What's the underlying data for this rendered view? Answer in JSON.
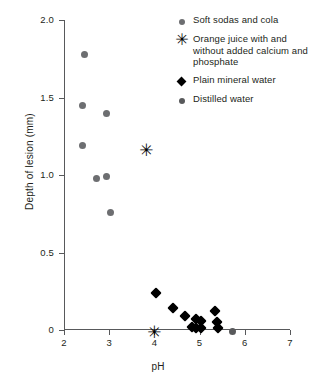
{
  "chart_data": {
    "type": "scatter",
    "title": "",
    "xlabel": "pH",
    "ylabel": "Depth of lesion (mm)",
    "xlim": [
      2,
      7
    ],
    "ylim": [
      0,
      2.0
    ],
    "xticks": [
      "2",
      "3",
      "4",
      "5",
      "6",
      "7"
    ],
    "xtick_values": [
      2,
      3,
      4,
      5,
      6,
      7
    ],
    "yticks": [
      "0",
      "0.5",
      "1.0",
      "1.5",
      "2.0"
    ],
    "ytick_values": [
      0,
      0.5,
      1.0,
      1.5,
      2.0
    ],
    "grid": false,
    "legend_position": "top-right",
    "series": [
      {
        "name": "Soft sodas and cola",
        "marker": "circle",
        "color": "#6d6e71",
        "points": [
          {
            "x": 2.45,
            "y": 1.78
          },
          {
            "x": 2.4,
            "y": 1.45
          },
          {
            "x": 2.95,
            "y": 1.4
          },
          {
            "x": 2.42,
            "y": 1.19
          },
          {
            "x": 2.72,
            "y": 0.98
          },
          {
            "x": 2.95,
            "y": 0.99
          },
          {
            "x": 3.03,
            "y": 0.76
          }
        ]
      },
      {
        "name": "Orange juice with and without added calcium and phosphate",
        "marker": "asterisk",
        "color": "#000000",
        "points": [
          {
            "x": 3.82,
            "y": 1.16
          },
          {
            "x": 4.0,
            "y": -0.01
          }
        ]
      },
      {
        "name": "Plain mineral water",
        "marker": "diamond",
        "color": "#000000",
        "points": [
          {
            "x": 4.03,
            "y": 0.24
          },
          {
            "x": 4.42,
            "y": 0.14
          },
          {
            "x": 4.67,
            "y": 0.09
          },
          {
            "x": 4.83,
            "y": 0.02
          },
          {
            "x": 4.92,
            "y": 0.07
          },
          {
            "x": 4.93,
            "y": 0.01
          },
          {
            "x": 5.02,
            "y": 0.06
          },
          {
            "x": 5.03,
            "y": 0.01
          },
          {
            "x": 5.35,
            "y": 0.12
          },
          {
            "x": 5.38,
            "y": 0.05
          },
          {
            "x": 5.4,
            "y": 0.01
          }
        ]
      },
      {
        "name": "Distilled water",
        "marker": "circle",
        "color": "#58595b",
        "points": [
          {
            "x": 5.72,
            "y": -0.01
          }
        ]
      }
    ]
  },
  "axes": {
    "x_title": "pH",
    "y_title": "Depth of lesion (mm)"
  },
  "legend": {
    "entries": [
      {
        "marker": "circle",
        "color": "#6d6e71",
        "label": "Soft sodas and cola"
      },
      {
        "marker": "asterisk",
        "color": "#000000",
        "label": "Orange juice with and without added calcium and phosphate"
      },
      {
        "marker": "diamond",
        "color": "#000000",
        "label": "Plain mineral water"
      },
      {
        "marker": "circle",
        "color": "#58595b",
        "label": "Distilled water"
      }
    ]
  },
  "glyphs": {
    "asterisk": "✳"
  }
}
